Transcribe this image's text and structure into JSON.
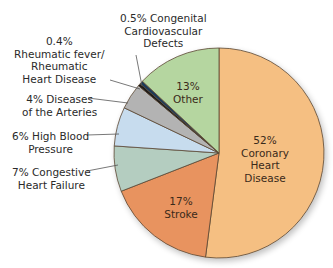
{
  "chart_data": {
    "type": "pie",
    "title": "",
    "start_angle": "top, clockwise",
    "slices": [
      {
        "label": "Coronary Heart Disease",
        "value": 52,
        "display": "52%",
        "color": "#f5bf82"
      },
      {
        "label": "Stroke",
        "value": 17,
        "display": "17%",
        "color": "#e8935f"
      },
      {
        "label": "Congestive Heart Failure",
        "value": 7,
        "display": "7%",
        "color": "#b4cdc0"
      },
      {
        "label": "High Blood Pressure",
        "value": 6,
        "display": "6%",
        "color": "#c7dcee"
      },
      {
        "label": "Diseases of the Arteries",
        "value": 4,
        "display": "4%",
        "color": "#b3b3b3"
      },
      {
        "label": "Rheumatic fever/ Rheumatic Heart Disease",
        "value": 0.4,
        "display": "0.4%",
        "color": "#1a1a1a"
      },
      {
        "label": "Congenital Cardiovascular Defects",
        "value": 0.5,
        "display": "0.5%",
        "color": "#1d3b5a"
      },
      {
        "label": "Other",
        "value": 13,
        "display": "13%",
        "color": "#b5d6a0"
      }
    ]
  },
  "labels": {
    "coronary": {
      "pct": "52%",
      "l1": "Coronary",
      "l2": "Heart",
      "l3": "Disease"
    },
    "stroke": {
      "pct": "17%",
      "l1": "Stroke"
    },
    "other": {
      "pct": "13%",
      "l1": "Other"
    },
    "congenital": {
      "l1": "0.5% Congenital",
      "l2": "Cardiovascular",
      "l3": "Defects"
    },
    "rheumatic": {
      "l1": "0.4%",
      "l2": "Rheumatic fever/",
      "l3": "Rheumatic",
      "l4": "Heart Disease"
    },
    "arteries": {
      "l1": "4% Diseases",
      "l2": "of the Arteries"
    },
    "hbp": {
      "l1": "6% High Blood",
      "l2": "Pressure"
    },
    "chf": {
      "l1": "7% Congestive",
      "l2": "Heart Failure"
    }
  }
}
